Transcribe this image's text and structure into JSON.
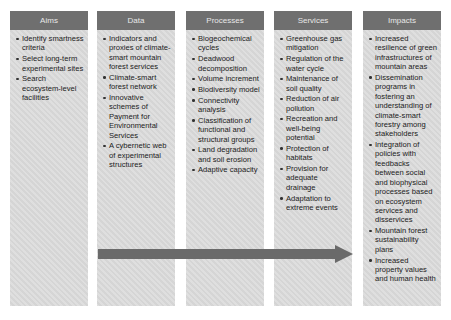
{
  "columns": [
    {
      "title": "Aims",
      "items": [
        "Identify smartness criteria",
        "Select long-term experimental sites",
        "Search ecosystem-level facilities"
      ]
    },
    {
      "title": "Data",
      "items": [
        "Indicators and proxies of climate-smart mountain forest services",
        "Climate-smart forest network",
        "Innovative schemes of Payment for Environmental Services",
        "A cybernetic web of experimental structures"
      ]
    },
    {
      "title": "Processes",
      "items": [
        "Biogeochemical cycles",
        "Deadwood decomposition",
        "Volume increment",
        "Biodiversity model",
        "Connectivity analysis",
        "Classification of functional and structural groups",
        "Land degradation and soil erosion",
        "Adaptive capacity"
      ]
    },
    {
      "title": "Services",
      "items": [
        "Greenhouse gas mitigation",
        "Regulation of the water cycle",
        "Maintenance of soil quality",
        "Reduction of air pollution",
        "Recreation and well-being potential",
        "Protection of habitats",
        "Provision for adequate drainage",
        "Adaptation to extreme events"
      ]
    },
    {
      "title": "Impacts",
      "items": [
        "Increased resilience of green infrastructures of mountain areas",
        "Dissemination programs in fostering an understanding of climate-smart forestry among stakeholders",
        "Integration of policies with feedbacks between social and biophysical processes based on ecosystem services and disservices",
        "Mountain forest sustainability plans",
        "Increased property values and human health"
      ]
    }
  ],
  "arrow": {
    "direction": "right",
    "from": "Data",
    "to": "Impacts"
  },
  "colors": {
    "header": "#6f6f6f",
    "body": "#dcdcdc",
    "arrow": "#6a6a6a"
  }
}
